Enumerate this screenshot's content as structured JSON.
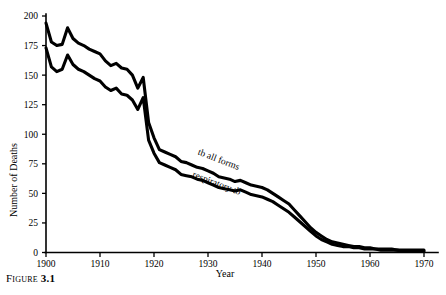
{
  "figure": {
    "caption_label": "Figure",
    "caption_number": "3.1"
  },
  "chart_data": {
    "type": "line",
    "title": "",
    "xlabel": "Year",
    "ylabel": "Number of Deaths",
    "xlim": [
      1900,
      1970
    ],
    "ylim": [
      0,
      200
    ],
    "grid": false,
    "legend": "inline-annotations",
    "x_ticks": [
      1900,
      1910,
      1920,
      1930,
      1940,
      1950,
      1960,
      1970
    ],
    "y_ticks": [
      0,
      25,
      50,
      75,
      100,
      125,
      150,
      175,
      200
    ],
    "x_tick_labels": [
      "1900",
      "1910",
      "1920",
      "1930",
      "1940",
      "1950",
      "1960",
      "1970"
    ],
    "y_tick_labels": [
      "0",
      "25",
      "50",
      "75",
      "100",
      "125",
      "150",
      "175",
      "200"
    ],
    "annotations": [
      {
        "text": "tb all forms",
        "x": 1928,
        "y": 83,
        "rotation": 21
      },
      {
        "text": "respiratory tb",
        "x": 1927,
        "y": 64,
        "rotation": 21
      }
    ],
    "series": [
      {
        "name": "tb all forms",
        "x": [
          1900,
          1901,
          1902,
          1903,
          1904,
          1905,
          1906,
          1907,
          1908,
          1909,
          1910,
          1911,
          1912,
          1913,
          1914,
          1915,
          1916,
          1917,
          1918,
          1919,
          1920,
          1921,
          1922,
          1923,
          1924,
          1925,
          1926,
          1927,
          1928,
          1929,
          1930,
          1931,
          1932,
          1933,
          1934,
          1935,
          1936,
          1937,
          1938,
          1939,
          1940,
          1941,
          1942,
          1943,
          1944,
          1945,
          1946,
          1947,
          1948,
          1949,
          1950,
          1951,
          1952,
          1953,
          1954,
          1955,
          1956,
          1957,
          1958,
          1959,
          1960,
          1961,
          1962,
          1963,
          1964,
          1965,
          1966,
          1967,
          1968,
          1969,
          1970
        ],
        "values": [
          194,
          178,
          175,
          176,
          190,
          181,
          177,
          175,
          172,
          170,
          168,
          162,
          158,
          160,
          156,
          155,
          150,
          139,
          148,
          110,
          97,
          87,
          85,
          83,
          81,
          77,
          76,
          74,
          72,
          71,
          69,
          67,
          64,
          63,
          62,
          60,
          61,
          59,
          57,
          56,
          55,
          53,
          50,
          47,
          44,
          41,
          36,
          31,
          26,
          21,
          17,
          14,
          11,
          9,
          8,
          7,
          6,
          5,
          5,
          4,
          4,
          3,
          3,
          3,
          3,
          2,
          2,
          2,
          2,
          2,
          2
        ]
      },
      {
        "name": "respiratory tb",
        "x": [
          1900,
          1901,
          1902,
          1903,
          1904,
          1905,
          1906,
          1907,
          1908,
          1909,
          1910,
          1911,
          1912,
          1913,
          1914,
          1915,
          1916,
          1917,
          1918,
          1919,
          1920,
          1921,
          1922,
          1923,
          1924,
          1925,
          1926,
          1927,
          1928,
          1929,
          1930,
          1931,
          1932,
          1933,
          1934,
          1935,
          1936,
          1937,
          1938,
          1939,
          1940,
          1941,
          1942,
          1943,
          1944,
          1945,
          1946,
          1947,
          1948,
          1949,
          1950,
          1951,
          1952,
          1953,
          1954,
          1955,
          1956,
          1957,
          1958,
          1959,
          1960,
          1961,
          1962,
          1963,
          1964,
          1965,
          1966,
          1967,
          1968,
          1969,
          1970
        ],
        "values": [
          173,
          157,
          153,
          155,
          167,
          159,
          155,
          153,
          150,
          147,
          145,
          140,
          137,
          139,
          134,
          133,
          129,
          121,
          131,
          95,
          84,
          76,
          74,
          72,
          70,
          66,
          65,
          64,
          62,
          61,
          59,
          57,
          55,
          54,
          53,
          52,
          53,
          51,
          49,
          48,
          47,
          45,
          43,
          40,
          37,
          34,
          30,
          26,
          22,
          18,
          14,
          11,
          9,
          7,
          6,
          5,
          5,
          4,
          4,
          3,
          3,
          3,
          2,
          2,
          2,
          2,
          1,
          1,
          1,
          1,
          1
        ]
      }
    ]
  }
}
